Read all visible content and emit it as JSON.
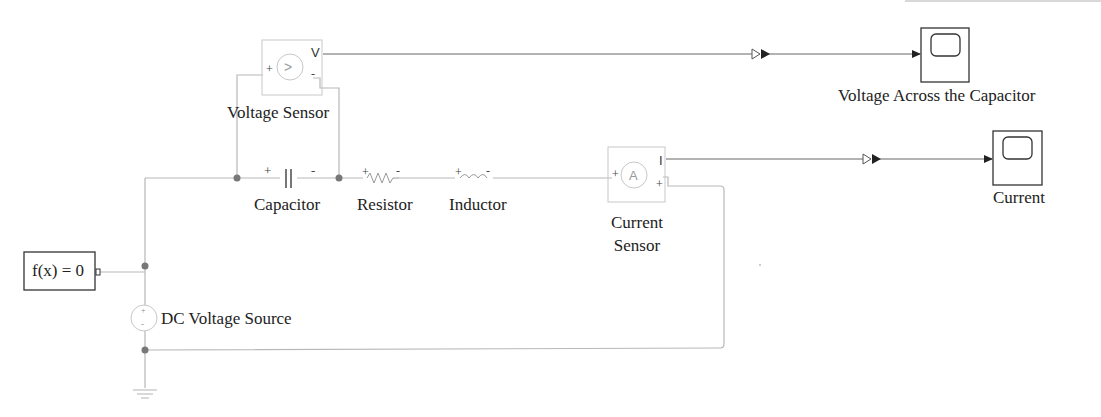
{
  "diagram": {
    "type": "Simulink/Simscape RLC circuit",
    "blocks": {
      "voltage_sensor": {
        "label": "Voltage Sensor",
        "plus": "+",
        "minus": "-",
        "out": "V",
        "glyph": ">"
      },
      "capacitor": {
        "label": "Capacitor",
        "plus": "+",
        "minus": "-"
      },
      "resistor": {
        "label": "Resistor",
        "plus": "+",
        "minus": "-"
      },
      "inductor": {
        "label": "Inductor",
        "plus": "+",
        "minus": "-"
      },
      "current_sensor": {
        "label_line1": "Current",
        "label_line2": "Sensor",
        "plus": "+",
        "minus": "-",
        "out": "I",
        "glyph": "A"
      },
      "solver": {
        "label": "f(x) = 0"
      },
      "dc_source": {
        "label": "DC Voltage Source",
        "plus": "+",
        "minus": "-"
      },
      "scope_voltage": {
        "label": "Voltage Across the Capacitor"
      },
      "scope_current": {
        "label": "Current"
      }
    },
    "colors": {
      "wire": "#b8b8b8",
      "signal": "#555555",
      "node": "#777777",
      "block_border": "#c8c8c8",
      "scope_border": "#333333"
    }
  }
}
